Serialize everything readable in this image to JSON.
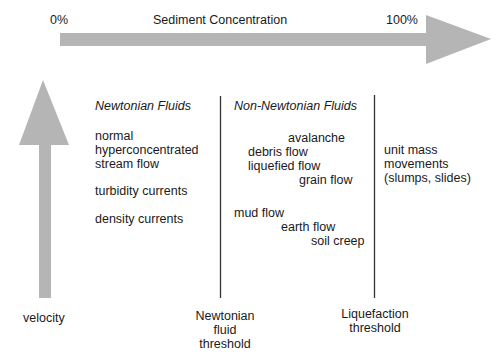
{
  "axes": {
    "horizontal": {
      "label": "Sediment Concentration",
      "start_label": "0%",
      "end_label": "100%",
      "color": "#b5b5b5"
    },
    "vertical": {
      "label": "velocity",
      "color": "#b5b5b5"
    }
  },
  "regions": {
    "newtonian": {
      "title": "Newtonian Fluids",
      "items": [
        "normal",
        "hyperconcentrated",
        "stream flow",
        "turbidity currents",
        "density currents"
      ]
    },
    "non_newtonian": {
      "title": "Non-Newtonian Fluids",
      "items": [
        "avalanche",
        "debris flow",
        "liquefied flow",
        "grain flow",
        "mud flow",
        "earth flow",
        "soil creep"
      ]
    },
    "unit_mass": {
      "items": [
        "unit mass",
        "movements",
        "(slumps, slides)"
      ]
    }
  },
  "thresholds": {
    "newtonian": {
      "lines": [
        "Newtonian",
        "fluid",
        "threshold"
      ]
    },
    "liquefaction": {
      "lines": [
        "Liquefaction",
        "threshold"
      ]
    }
  }
}
